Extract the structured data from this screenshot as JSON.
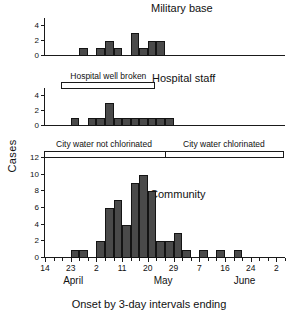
{
  "figure": {
    "xlabel": "Onset by 3-day intervals ending",
    "ylabel": "Cases"
  },
  "chart_data": {
    "type": "bar",
    "title": "",
    "xlabel": "Onset by 3-day intervals ending",
    "ylabel": "Cases",
    "grid": false,
    "legend": "none",
    "x_tick_labels": [
      "14",
      "23",
      "2",
      "11",
      "20",
      "29",
      "7",
      "16",
      "24",
      "2"
    ],
    "x_month_labels": [
      "April",
      "May",
      "June"
    ],
    "x_interval_days": 3,
    "x_axis_note": "3-day interval bins; labelled ticks every 3rd bin",
    "panels": [
      {
        "name": "Military base",
        "ylim": [
          0,
          5
        ],
        "y_tick_labels": [
          "0",
          "2",
          "4"
        ],
        "y_ticks": [
          0,
          2,
          4
        ],
        "bins": [
          0,
          1,
          2,
          3,
          4,
          5,
          6,
          7,
          8,
          9,
          10,
          11,
          12,
          13,
          14,
          15,
          16,
          17,
          18,
          19,
          20,
          21,
          22,
          23,
          24,
          25,
          26,
          27
        ],
        "values": [
          0,
          0,
          0,
          0,
          1,
          0,
          1,
          2,
          1,
          0,
          3,
          1,
          2,
          2,
          0,
          0,
          0,
          0,
          0,
          0,
          0,
          0,
          0,
          0,
          0,
          0,
          0,
          0
        ]
      },
      {
        "name": "Hospital staff",
        "ylim": [
          0,
          5
        ],
        "y_tick_labels": [
          "0",
          "2",
          "4"
        ],
        "y_ticks": [
          0,
          2,
          4
        ],
        "bins": [
          0,
          1,
          2,
          3,
          4,
          5,
          6,
          7,
          8,
          9,
          10,
          11,
          12,
          13,
          14,
          15,
          16,
          17,
          18,
          19,
          20,
          21,
          22,
          23,
          24,
          25,
          26,
          27
        ],
        "values": [
          0,
          0,
          0,
          1,
          0,
          1,
          1,
          3,
          1,
          1,
          1,
          1,
          1,
          1,
          1,
          0,
          0,
          0,
          0,
          0,
          0,
          0,
          0,
          0,
          0,
          0,
          0,
          0
        ]
      },
      {
        "name": "Community",
        "ylim": [
          0,
          12
        ],
        "y_tick_labels": [
          "0",
          "2",
          "4",
          "6",
          "8",
          "10",
          "12"
        ],
        "y_ticks": [
          0,
          2,
          4,
          6,
          8,
          10,
          12
        ],
        "bins": [
          0,
          1,
          2,
          3,
          4,
          5,
          6,
          7,
          8,
          9,
          10,
          11,
          12,
          13,
          14,
          15,
          16,
          17,
          18,
          19,
          20,
          21,
          22,
          23,
          24,
          25,
          26,
          27
        ],
        "values": [
          0,
          0,
          0,
          1,
          1,
          0,
          2,
          6,
          7,
          4,
          9,
          10,
          8,
          2,
          2,
          3,
          1,
          0,
          1,
          0,
          1,
          0,
          1,
          0,
          0,
          0,
          0,
          0
        ]
      }
    ],
    "annotations": [
      {
        "id": "hospital-well-broken",
        "text": "Hospital well broken",
        "panel": "Hospital staff",
        "start_bin": 2,
        "end_bin": 13
      },
      {
        "id": "city-water-not-chlorinated",
        "text": "City water not chlorinated",
        "panel": "Community",
        "start_bin": 0,
        "end_bin": 14
      },
      {
        "id": "city-water-chlorinated",
        "text": "City water chlorinated",
        "panel": "Community",
        "start_bin": 14,
        "end_bin": 28
      }
    ]
  }
}
